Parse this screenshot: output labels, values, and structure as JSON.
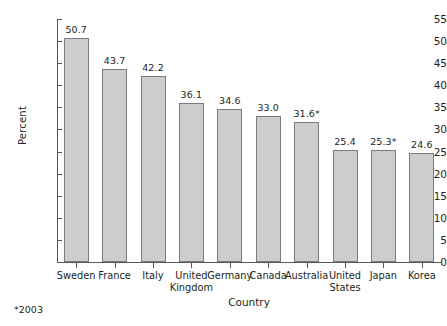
{
  "chart_data": {
    "type": "bar",
    "title": "",
    "xlabel": "Country",
    "ylabel": "Percent",
    "ylim": [
      0,
      55
    ],
    "ytick_step": 5,
    "yticks": [
      "0",
      "5",
      "10",
      "15",
      "20",
      "25",
      "30",
      "35",
      "40",
      "45",
      "50",
      "55"
    ],
    "grid": false,
    "legend": "none",
    "categories": [
      "Sweden",
      "France",
      "Italy",
      "United Kingdom",
      "Germany",
      "Canada",
      "Australia",
      "United States",
      "Japan",
      "Korea"
    ],
    "category_lines": [
      [
        "Sweden",
        ""
      ],
      [
        "France",
        ""
      ],
      [
        "Italy",
        ""
      ],
      [
        "United",
        "Kingdom"
      ],
      [
        "Germany",
        ""
      ],
      [
        "Canada",
        ""
      ],
      [
        "Australia",
        ""
      ],
      [
        "United",
        "States"
      ],
      [
        "Japan",
        ""
      ],
      [
        "Korea",
        ""
      ]
    ],
    "values": [
      50.7,
      43.7,
      42.2,
      36.1,
      34.6,
      33.0,
      31.6,
      25.4,
      25.3,
      24.6
    ],
    "value_labels": [
      "50.7",
      "43.7",
      "42.2",
      "36.1",
      "34.6",
      "33.0",
      "31.6*",
      "25.4",
      "25.3*",
      "24.6"
    ],
    "bar_color": "#cdcdcd",
    "bar_border_color": "#7b7b7d",
    "axis_color": "#58585a",
    "text_color": "#231f20"
  },
  "footnote": "*2003"
}
